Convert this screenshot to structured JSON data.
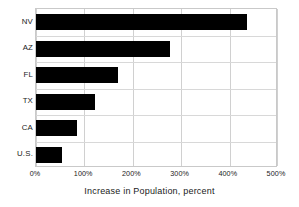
{
  "chart_data": {
    "type": "bar",
    "orientation": "horizontal",
    "title": "",
    "xlabel": "Increase in Population, percent",
    "ylabel": "",
    "categories": [
      "NV",
      "AZ",
      "FL",
      "TX",
      "CA",
      "U.S."
    ],
    "values": [
      438,
      279,
      171,
      122,
      85,
      54
    ],
    "xlim": [
      0,
      500
    ],
    "xticks": [
      0,
      100,
      200,
      300,
      400,
      500
    ],
    "xtick_labels": [
      "0%",
      "100%",
      "200%",
      "300%",
      "400%",
      "500%"
    ],
    "grid": true,
    "legend": null,
    "bar_color": "#000000",
    "grid_color": "#d0d0d0",
    "background": "#ffffff",
    "text_color": "#1a1a1a"
  }
}
